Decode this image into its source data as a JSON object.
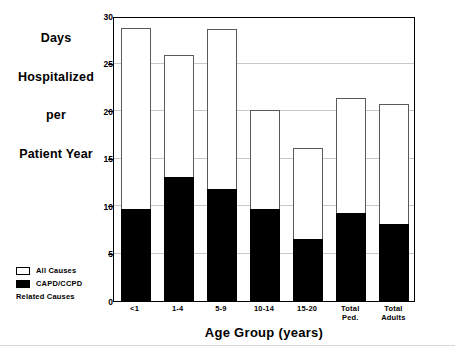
{
  "chart_data": {
    "type": "bar",
    "title": "",
    "subtitle": "",
    "xlabel": "Age Group (years)",
    "ylabel": "Days Hospitalized per Patient Year",
    "ylabel_lines": [
      "Days",
      "Hospitalized",
      "per",
      "Patient Year"
    ],
    "categories": [
      "<1",
      "1-4",
      "5-9",
      "10-14",
      "15-20",
      "Total\nPed.",
      "Total\nAdults"
    ],
    "category_labels_plain": [
      "<1",
      "1-4",
      "5-9",
      "10-14",
      "15-20",
      "Total Ped.",
      "Total Adults"
    ],
    "series": [
      {
        "name": "All Causes",
        "color": "#ffffff",
        "edge_color": "#5a5a5a",
        "values": [
          28.7,
          25.9,
          28.6,
          20.1,
          16.1,
          21.4,
          20.7
        ]
      },
      {
        "name": "CAPD/CCPD Related Causes",
        "color": "#000000",
        "edge_color": "#000000",
        "values": [
          9.7,
          13.1,
          11.8,
          9.7,
          6.5,
          9.3,
          8.1
        ]
      }
    ],
    "stacked_overlay": true,
    "ylim": [
      0,
      30
    ],
    "yticks": [
      0,
      5,
      10,
      15,
      20,
      25,
      30
    ],
    "yticklabels": [
      "0",
      "5",
      "10",
      "15",
      "20",
      "25",
      "30"
    ],
    "grid": true,
    "grid_axis": "y",
    "grid_color": "#c9c9c9",
    "legend_position": "outside-lower-left",
    "legend": [
      {
        "label": "All Causes",
        "sublabel": "",
        "swatch": "white"
      },
      {
        "label": "CAPD/CCPD",
        "sublabel": "Related Causes",
        "swatch": "black"
      }
    ]
  }
}
